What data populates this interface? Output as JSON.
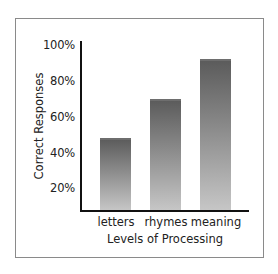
{
  "chart_data": {
    "type": "bar",
    "title": "",
    "xlabel": "Levels of Processing",
    "ylabel": "Correct Responses",
    "categories": [
      "letters",
      "rhymes",
      "meaning"
    ],
    "values": [
      48,
      70,
      92
    ],
    "value_unit": "%",
    "ylim": [
      13,
      100
    ],
    "yticks": [
      20,
      40,
      60,
      80,
      100
    ],
    "ytick_labels": [
      "20%",
      "40%",
      "60%",
      "80%",
      "100%"
    ],
    "grid": false,
    "legend": null,
    "bar_style": "vertical gradient dark-gray top to light-gray bottom"
  },
  "colors": {
    "bar_top": "#5a5a5a",
    "bar_bottom": "#c6c6c6",
    "axis": "#111111",
    "frame": "#8a8a8a",
    "text": "#222222"
  }
}
